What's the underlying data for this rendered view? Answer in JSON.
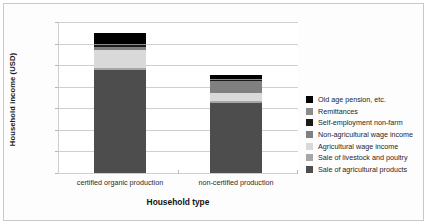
{
  "figure": {
    "frame_color": "#c8c8c8",
    "background": "#ffffff"
  },
  "axes": {
    "ylabel": "Household income (USD)",
    "xlabel": "Household type",
    "yticks": [
      "7000",
      "6000",
      "5000",
      "4000",
      "3000",
      "2000",
      "1000",
      "0"
    ]
  },
  "chart_data": {
    "type": "bar",
    "subtype": "stacked-bar",
    "title": "",
    "xlabel": "Household type",
    "ylabel": "Household income (USD)",
    "ylim": [
      0,
      7000
    ],
    "ytick_step": 1000,
    "grid": true,
    "legend_position": "right",
    "categories": [
      "certified organic production",
      "non-certified production"
    ],
    "series": [
      {
        "name": "Sale of agricultural products",
        "color": "#4d4d4d",
        "values": [
          4780,
          3250
        ]
      },
      {
        "name": "Sale of livestock and poultry",
        "color": "#a6a6a6",
        "values": [
          75,
          80
        ]
      },
      {
        "name": "Agricultural wage income",
        "color": "#d9d9d9",
        "values": [
          845,
          380
        ]
      },
      {
        "name": "Non-agricultural wage income",
        "color": "#808080",
        "values": [
          130,
          545
        ]
      },
      {
        "name": "Self-employment non-farm",
        "color": "#1a1a1a",
        "values": [
          90,
          55
        ]
      },
      {
        "name": "Remittances",
        "color": "#8c8c8c",
        "values": [
          70,
          50
        ]
      },
      {
        "name": "Old age pension, etc.",
        "color": "#000000",
        "values": [
          490,
          200
        ]
      }
    ],
    "totals": [
      6480,
      4560
    ]
  },
  "legend": {
    "items": [
      {
        "label": "Old age pension, etc.",
        "color": "#000000"
      },
      {
        "label": "Remittances",
        "color": "#8c8c8c"
      },
      {
        "label": "Self-employment non-farm",
        "color": "#1a1a1a"
      },
      {
        "label": "Non-agricultural wage income",
        "color": "#808080"
      },
      {
        "label": "Agricultural wage income",
        "color": "#d9d9d9"
      },
      {
        "label": "Sale of livestock and poultry",
        "color": "#a6a6a6"
      },
      {
        "label": "Sale of agricultural products",
        "color": "#4d4d4d"
      }
    ]
  }
}
